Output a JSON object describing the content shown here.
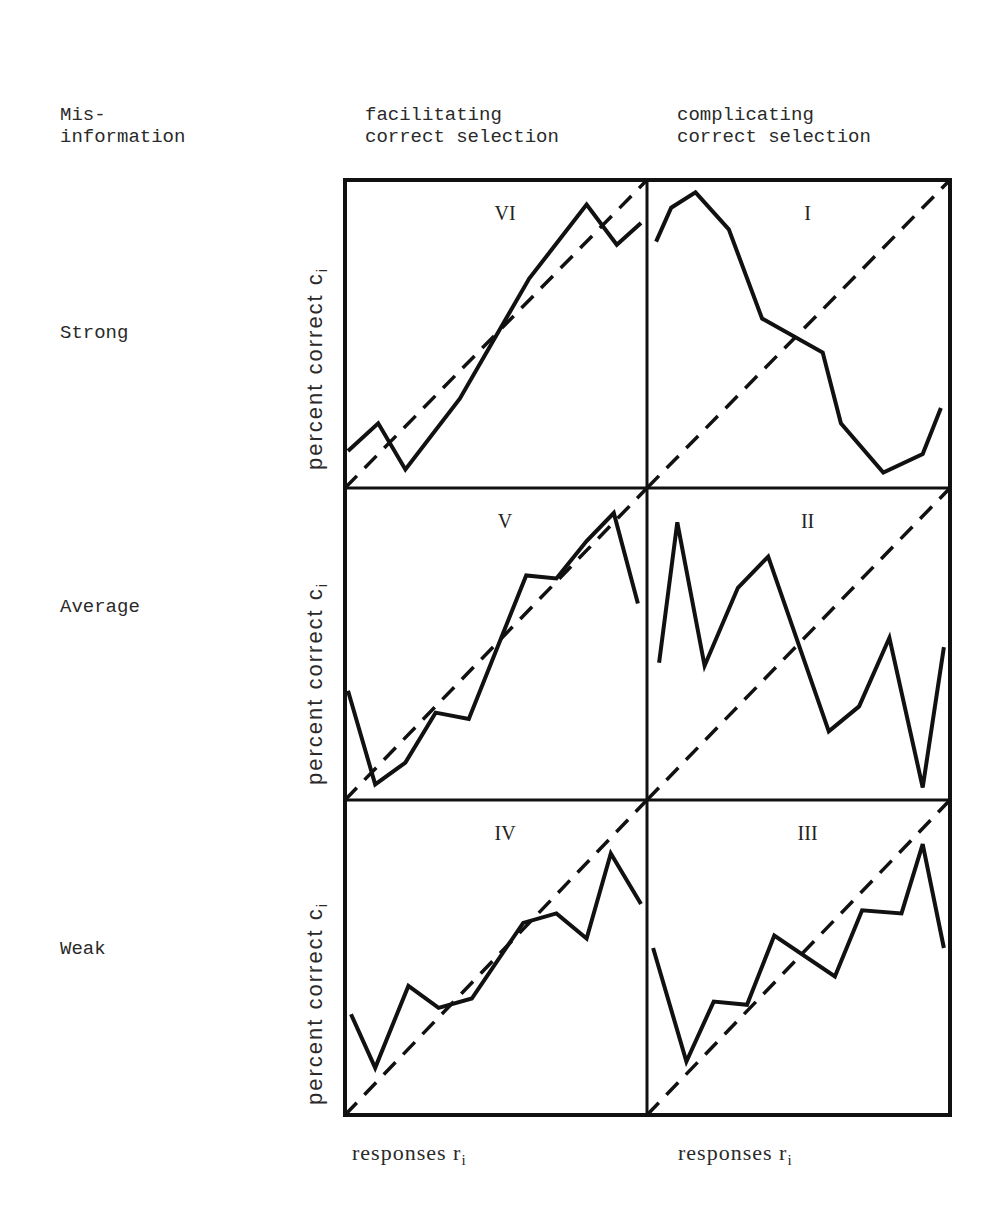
{
  "header": {
    "row_axis_title_line1": "Mis-",
    "row_axis_title_line2": "information",
    "col1_line1": "facilitating",
    "col1_line2": "correct selection",
    "col2_line1": "complicating",
    "col2_line2": "correct selection"
  },
  "rows": [
    {
      "label": "Strong"
    },
    {
      "label": "Average"
    },
    {
      "label": "Weak"
    }
  ],
  "axes": {
    "ylabel_text": "percent correct c",
    "ylabel_sub": "i",
    "xlabel_text": "responses r",
    "xlabel_sub": "i"
  },
  "colors": {
    "line": "#111111",
    "frame": "#111111",
    "background": "#ffffff"
  },
  "chart_data": [
    {
      "type": "line",
      "panel": "VI",
      "row": "Strong",
      "column": "facilitating correct selection",
      "xlabel": "responses r_i",
      "ylabel": "percent correct c_i",
      "xlim": [
        0,
        100
      ],
      "ylim": [
        0,
        100
      ],
      "grid": false,
      "series": [
        {
          "name": "observed",
          "style": "solid",
          "x": [
            1,
            11,
            20,
            38,
            61,
            80,
            90,
            98
          ],
          "y": [
            12,
            21,
            6,
            29,
            68,
            92,
            79,
            86
          ]
        },
        {
          "name": "diagonal (r = c)",
          "style": "dashed",
          "x": [
            0,
            100
          ],
          "y": [
            0,
            100
          ]
        }
      ]
    },
    {
      "type": "line",
      "panel": "I",
      "row": "Strong",
      "column": "complicating correct selection",
      "xlabel": "responses r_i",
      "ylabel": "percent correct c_i",
      "xlim": [
        0,
        100
      ],
      "ylim": [
        0,
        100
      ],
      "grid": false,
      "series": [
        {
          "name": "observed",
          "style": "solid",
          "x": [
            3,
            8,
            16,
            27,
            38,
            58,
            64,
            78,
            91,
            97
          ],
          "y": [
            80,
            91,
            96,
            84,
            55,
            44,
            21,
            5,
            11,
            26
          ]
        },
        {
          "name": "diagonal (r = c)",
          "style": "dashed",
          "x": [
            0,
            100
          ],
          "y": [
            0,
            100
          ]
        }
      ]
    },
    {
      "type": "line",
      "panel": "V",
      "row": "Average",
      "column": "facilitating correct selection",
      "xlabel": "responses r_i",
      "ylabel": "percent correct c_i",
      "xlim": [
        0,
        100
      ],
      "ylim": [
        0,
        100
      ],
      "grid": false,
      "series": [
        {
          "name": "observed",
          "style": "solid",
          "x": [
            1,
            10,
            20,
            30,
            41,
            60,
            70,
            80,
            89,
            97
          ],
          "y": [
            35,
            5,
            12,
            28,
            26,
            72,
            71,
            83,
            92,
            63
          ]
        },
        {
          "name": "diagonal (r = c)",
          "style": "dashed",
          "x": [
            0,
            100
          ],
          "y": [
            0,
            100
          ]
        }
      ]
    },
    {
      "type": "line",
      "panel": "II",
      "row": "Average",
      "column": "complicating correct selection",
      "xlabel": "responses r_i",
      "ylabel": "percent correct c_i",
      "xlim": [
        0,
        100
      ],
      "ylim": [
        0,
        100
      ],
      "grid": false,
      "series": [
        {
          "name": "observed",
          "style": "solid",
          "x": [
            4,
            10,
            19,
            30,
            40,
            60,
            70,
            80,
            91,
            98
          ],
          "y": [
            44,
            89,
            43,
            68,
            78,
            22,
            30,
            52,
            4,
            49
          ]
        },
        {
          "name": "diagonal (r = c)",
          "style": "dashed",
          "x": [
            0,
            100
          ],
          "y": [
            0,
            100
          ]
        }
      ]
    },
    {
      "type": "line",
      "panel": "IV",
      "row": "Weak",
      "column": "facilitating correct selection",
      "xlabel": "responses r_i",
      "ylabel": "percent correct c_i",
      "xlim": [
        0,
        100
      ],
      "ylim": [
        0,
        100
      ],
      "grid": false,
      "series": [
        {
          "name": "observed",
          "style": "solid",
          "x": [
            2,
            10,
            21,
            31,
            42,
            59,
            70,
            80,
            88,
            98
          ],
          "y": [
            32,
            15,
            41,
            34,
            37,
            61,
            64,
            56,
            83,
            67
          ]
        },
        {
          "name": "diagonal (r = c)",
          "style": "dashed",
          "x": [
            0,
            100
          ],
          "y": [
            0,
            100
          ]
        }
      ]
    },
    {
      "type": "line",
      "panel": "III",
      "row": "Weak",
      "column": "complicating correct selection",
      "xlabel": "responses r_i",
      "ylabel": "percent correct c_i",
      "xlim": [
        0,
        100
      ],
      "ylim": [
        0,
        100
      ],
      "grid": false,
      "series": [
        {
          "name": "observed",
          "style": "solid",
          "x": [
            2,
            13,
            22,
            33,
            42,
            62,
            71,
            84,
            91,
            98
          ],
          "y": [
            53,
            17,
            36,
            35,
            57,
            44,
            65,
            64,
            86,
            53
          ]
        },
        {
          "name": "diagonal (r = c)",
          "style": "dashed",
          "x": [
            0,
            100
          ],
          "y": [
            0,
            100
          ]
        }
      ]
    }
  ]
}
